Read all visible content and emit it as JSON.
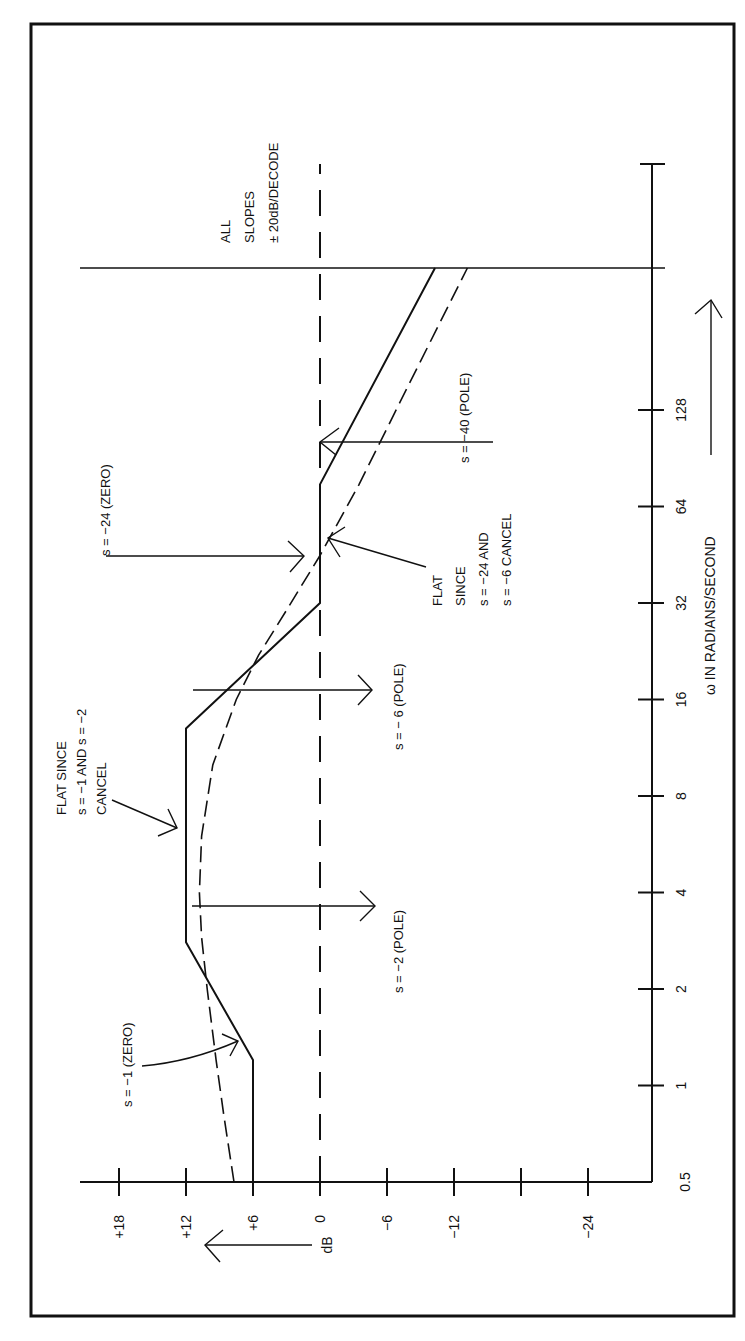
{
  "chart_data": {
    "type": "line",
    "title": "",
    "orientation": "rotated-90-ccw",
    "xlabel": "ω IN RADIANS/SECOND",
    "ylabel": "dB",
    "x_scale": "log2",
    "x_ticks": [
      0.5,
      1,
      2,
      4,
      8,
      16,
      32,
      64,
      128
    ],
    "x_tick_labels": [
      "0.5",
      "1",
      "2",
      "4",
      "8",
      "16",
      "32",
      "64",
      "128"
    ],
    "y_ticks": [
      18,
      12,
      6,
      0,
      -6,
      -12,
      -18,
      -24
    ],
    "y_tick_labels": [
      "+18",
      "+12",
      "+6",
      "0",
      "-6",
      "-12",
      "",
      "-24"
    ],
    "ylim": [
      -30,
      21
    ],
    "grid": false,
    "series": [
      {
        "name": "Asymptotic Bode magnitude",
        "style": "solid",
        "x": [
          0.5,
          1.2,
          2.8,
          13,
          32,
          75,
          390
        ],
        "y": [
          6,
          6,
          12,
          12,
          0,
          0,
          -10.3
        ]
      },
      {
        "name": "Actual magnitude",
        "style": "dashed-long",
        "x": [
          0.5,
          0.8,
          1.2,
          2,
          2.9,
          4,
          6,
          10,
          16,
          22,
          30,
          45,
          75,
          150,
          390
        ],
        "y": [
          7.7,
          8.6,
          9.3,
          10.1,
          10.6,
          10.8,
          10.6,
          9.6,
          7.5,
          5.5,
          3.1,
          0,
          -3.5,
          -7.8,
          -13.2
        ]
      },
      {
        "name": "0 dB reference",
        "style": "dashed",
        "x": [
          0.5,
          700
        ],
        "y": [
          0,
          0
        ]
      }
    ],
    "annotations": [
      {
        "text_lines": [
          "s = −1 (ZERO)"
        ],
        "points_to": [
          1.2,
          6
        ]
      },
      {
        "text_lines": [
          "s = −2 (POLE)"
        ],
        "points_to": [
          2.8,
          12
        ]
      },
      {
        "text_lines": [
          "FLAT SINCE",
          "s = −1 AND s = −2",
          "CANCEL"
        ],
        "points_to": [
          6,
          12
        ]
      },
      {
        "text_lines": [
          "s = − 6 (POLE)"
        ],
        "points_to": [
          13,
          12
        ]
      },
      {
        "text_lines": [
          "s = −24 (ZERO)"
        ],
        "points_to": [
          32,
          0
        ]
      },
      {
        "text_lines": [
          "FLAT",
          "SINCE",
          "s = −24 AND",
          "s = −6 CANCEL"
        ],
        "points_to": [
          45,
          0
        ]
      },
      {
        "text_lines": [
          "s = −40 (POLE)"
        ],
        "points_to": [
          75,
          0
        ]
      },
      {
        "text_lines": [
          "ALL",
          "SLOPES",
          "± 20dB/DECODE"
        ],
        "points_to": null
      }
    ]
  },
  "labels": {
    "y_axis_unit": "dB",
    "x_axis_title": "ω IN RADIANS/SECOND",
    "anno_zero_1": "s = −1 (ZERO)",
    "anno_pole_2": "s = −2 (POLE)",
    "anno_flat1_l1": "FLAT SINCE",
    "anno_flat1_l2": "s = −1 AND s = −2",
    "anno_flat1_l3": "CANCEL",
    "anno_pole_6": "s = − 6 (POLE)",
    "anno_zero_24": "s = −24 (ZERO)",
    "anno_flat2_l1": "FLAT",
    "anno_flat2_l2": "SINCE",
    "anno_flat2_l3": "s = −24 AND",
    "anno_flat2_l4": "s = −6 CANCEL",
    "anno_pole_40": "s = −40 (POLE)",
    "anno_slopes_l1": "ALL",
    "anno_slopes_l2": "SLOPES",
    "anno_slopes_l3": "± 20dB/DECODE"
  },
  "colors": {
    "ink": "#111111",
    "paper": "#ffffff"
  }
}
